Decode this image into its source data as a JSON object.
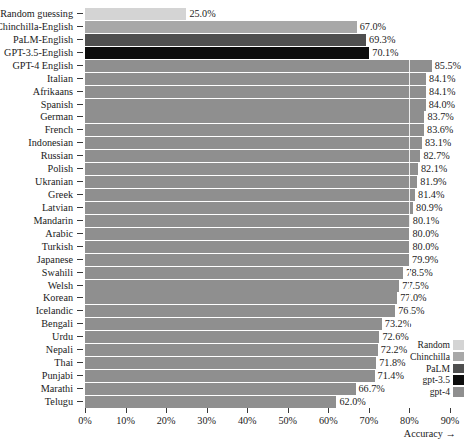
{
  "chart_data": {
    "type": "bar",
    "orientation": "horizontal",
    "title": "",
    "xlabel": "Accuracy →",
    "ylabel": "",
    "xlim": [
      0,
      92
    ],
    "grid": true,
    "gridlines": [
      80
    ],
    "xticks": [
      0,
      10,
      20,
      30,
      40,
      50,
      60,
      70,
      80,
      90
    ],
    "xticklabels": [
      "0%",
      "10%",
      "20%",
      "30%",
      "40%",
      "50%",
      "60%",
      "70%",
      "80%",
      "90%"
    ],
    "value_format": "{v}%",
    "legend_position": "right",
    "legend": [
      {
        "name": "Random",
        "color": "#d4d4d4"
      },
      {
        "name": "Chinchilla",
        "color": "#a8a8a8"
      },
      {
        "name": "PaLM",
        "color": "#4f4f4f"
      },
      {
        "name": "gpt-3.5",
        "color": "#0d0d0d"
      },
      {
        "name": "gpt-4",
        "color": "#8f8f8f"
      }
    ],
    "categories": [
      "Random guessing",
      "Chinchilla-English",
      "PaLM-English",
      "GPT-3.5-English",
      "GPT-4 English",
      "Italian",
      "Afrikaans",
      "Spanish",
      "German",
      "French",
      "Indonesian",
      "Russian",
      "Polish",
      "Ukranian",
      "Greek",
      "Latvian",
      "Mandarin",
      "Arabic",
      "Turkish",
      "Japanese",
      "Swahili",
      "Welsh",
      "Korean",
      "Icelandic",
      "Bengali",
      "Urdu",
      "Nepali",
      "Thai",
      "Punjabi",
      "Marathi",
      "Telugu"
    ],
    "values": [
      25.0,
      67.0,
      69.3,
      70.1,
      85.5,
      84.1,
      84.1,
      84.0,
      83.7,
      83.6,
      83.1,
      82.7,
      82.1,
      81.9,
      81.4,
      80.9,
      80.1,
      80.0,
      80.0,
      79.9,
      78.5,
      77.5,
      77.0,
      76.5,
      73.2,
      72.6,
      72.2,
      71.8,
      71.4,
      66.7,
      62.0
    ],
    "value_labels": [
      "25.0%",
      "67.0%",
      "69.3%",
      "70.1%",
      "85.5%",
      "84.1%",
      "84.1%",
      "84.0%",
      "83.7%",
      "83.6%",
      "83.1%",
      "82.7%",
      "82.1%",
      "81.9%",
      "81.4%",
      "80.9%",
      "80.1%",
      "80.0%",
      "80.0%",
      "79.9%",
      "78.5%",
      "77.5%",
      "77.0%",
      "76.5%",
      "73.2%",
      "72.6%",
      "72.2%",
      "71.8%",
      "71.4%",
      "66.7%",
      "62.0%"
    ],
    "series_of_bar": [
      "Random",
      "Chinchilla",
      "PaLM",
      "gpt-3.5",
      "gpt-4",
      "gpt-4",
      "gpt-4",
      "gpt-4",
      "gpt-4",
      "gpt-4",
      "gpt-4",
      "gpt-4",
      "gpt-4",
      "gpt-4",
      "gpt-4",
      "gpt-4",
      "gpt-4",
      "gpt-4",
      "gpt-4",
      "gpt-4",
      "gpt-4",
      "gpt-4",
      "gpt-4",
      "gpt-4",
      "gpt-4",
      "gpt-4",
      "gpt-4",
      "gpt-4",
      "gpt-4",
      "gpt-4",
      "gpt-4"
    ]
  }
}
